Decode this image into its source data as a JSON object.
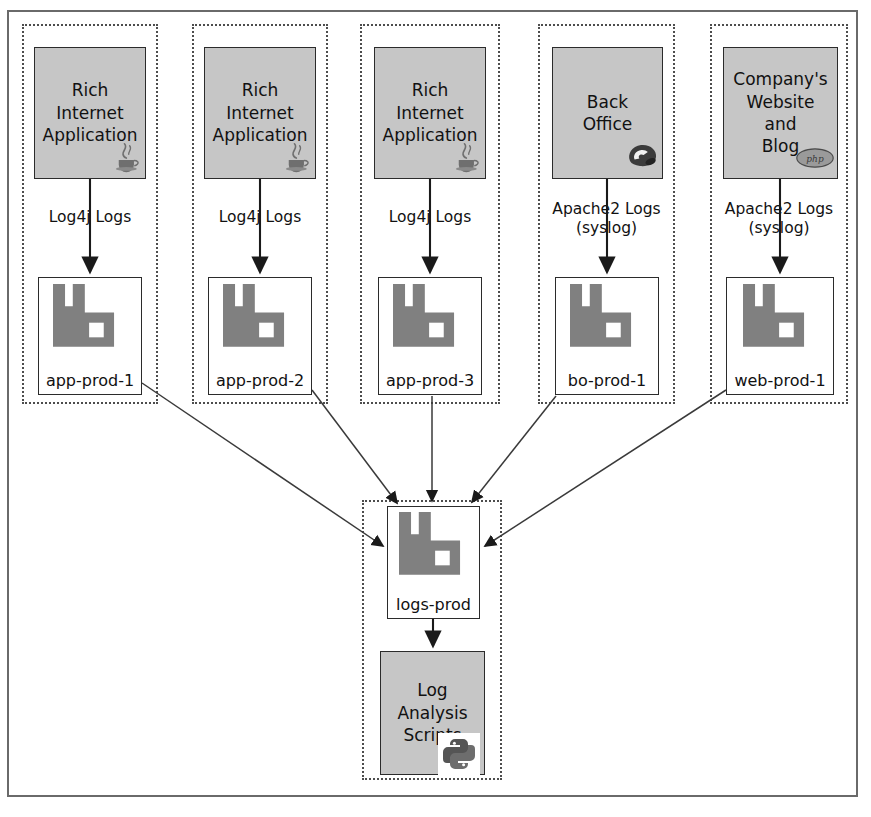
{
  "diagram": {
    "colors": {
      "app_box_fill": "#c6c6c6",
      "server_icon_fill": "#808080",
      "stroke": "#2b2b2b",
      "group_border": "#4d4d4d",
      "frame_border": "#6a6a6a",
      "background": "#ffffff"
    }
  },
  "groups": [
    {
      "id": "group-app-1",
      "source": {
        "name": "rich-internet-application-1",
        "lines": "Rich\nInternet\nApplication",
        "badge": "java-icon"
      },
      "edge_label": "Log4j Logs",
      "server": {
        "name": "app-prod-1",
        "label": "app-prod-1",
        "icon": "server-icon"
      }
    },
    {
      "id": "group-app-2",
      "source": {
        "name": "rich-internet-application-2",
        "lines": "Rich\nInternet\nApplication",
        "badge": "java-icon"
      },
      "edge_label": "Log4j Logs",
      "server": {
        "name": "app-prod-2",
        "label": "app-prod-2",
        "icon": "server-icon"
      }
    },
    {
      "id": "group-app-3",
      "source": {
        "name": "rich-internet-application-3",
        "lines": "Rich\nInternet\nApplication",
        "badge": "java-icon"
      },
      "edge_label": "Log4j Logs",
      "server": {
        "name": "app-prod-3",
        "label": "app-prod-3",
        "icon": "server-icon"
      }
    },
    {
      "id": "group-back-office",
      "source": {
        "name": "back-office",
        "lines": "Back\nOffice",
        "badge": "phone-icon"
      },
      "edge_label": "Apache2 Logs\n(syslog)",
      "server": {
        "name": "bo-prod-1",
        "label": "bo-prod-1",
        "icon": "server-icon"
      }
    },
    {
      "id": "group-website-blog",
      "source": {
        "name": "company-website-and-blog",
        "lines": "Company's\nWebsite\nand\nBlog",
        "badge": "php-icon"
      },
      "edge_label": "Apache2 Logs\n(syslog)",
      "server": {
        "name": "web-prod-1",
        "label": "web-prod-1",
        "icon": "server-icon"
      }
    }
  ],
  "central": {
    "group_id": "group-logs",
    "server": {
      "name": "logs-prod",
      "label": "logs-prod",
      "icon": "server-icon"
    },
    "consumer": {
      "name": "log-analysis-scripts",
      "lines": "Log\nAnalysis\nScripts",
      "badge": "python-icon"
    }
  },
  "badges": {
    "php_text": "php"
  }
}
